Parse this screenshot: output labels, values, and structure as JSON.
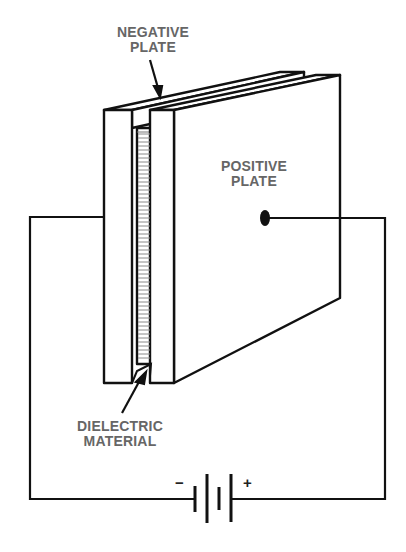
{
  "diagram": {
    "type": "capacitor-circuit",
    "labels": {
      "negative_plate": [
        "NEGATIVE",
        "PLATE"
      ],
      "positive_plate": [
        "POSITIVE",
        "PLATE"
      ],
      "dielectric": [
        "DIELECTRIC",
        "MATERIAL"
      ]
    },
    "battery": {
      "minus_sign": "−",
      "plus_sign": "+"
    },
    "colors": {
      "line": "#111111",
      "label": "#666666"
    }
  }
}
